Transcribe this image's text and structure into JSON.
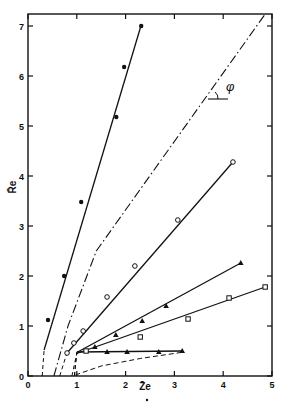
{
  "chart_data": {
    "type": "line",
    "title": "",
    "xlabel": "Z̄e",
    "ylabel": "R̄e",
    "xlim": [
      0,
      5
    ],
    "ylim": [
      0,
      7.24
    ],
    "grid": false,
    "legend": null,
    "x_ticks": [
      0,
      1,
      2,
      3,
      4,
      5
    ],
    "y_ticks": [
      0,
      1,
      2,
      3,
      4,
      5,
      6,
      7
    ],
    "x_tick_labels": [
      "0",
      "1",
      "2",
      "3",
      "4",
      "5"
    ],
    "y_tick_labels": [
      "0",
      "1",
      "2",
      "3",
      "4",
      "5",
      "6",
      "7"
    ],
    "annotations": [
      {
        "text": "φ",
        "x": 4.18,
        "y": 5.65,
        "note": "angle symbol marking slope of dash-dot line"
      }
    ],
    "series": [
      {
        "name": "filled circles",
        "marker": "filled-circle",
        "points": [
          [
            0.41,
            1.12
          ],
          [
            0.74,
            2.0
          ],
          [
            1.09,
            3.48
          ],
          [
            1.81,
            5.18
          ],
          [
            1.97,
            6.18
          ],
          [
            2.32,
            7.0
          ]
        ],
        "fit_line": [
          [
            0.33,
            0.52
          ],
          [
            2.32,
            7.02
          ]
        ],
        "dashed_extension": [
          [
            0.29,
            0.0
          ],
          [
            0.33,
            0.52
          ]
        ]
      },
      {
        "name": "open circles",
        "marker": "open-circle",
        "points": [
          [
            0.8,
            0.46
          ],
          [
            0.94,
            0.66
          ],
          [
            1.13,
            0.9
          ],
          [
            1.62,
            1.58
          ],
          [
            2.19,
            2.2
          ],
          [
            3.07,
            3.12
          ],
          [
            4.2,
            4.28
          ]
        ],
        "fit_line": [
          [
            0.8,
            0.46
          ],
          [
            4.2,
            4.28
          ]
        ],
        "dashed_extension": [
          [
            0.65,
            0.0
          ],
          [
            0.8,
            0.46
          ]
        ]
      },
      {
        "name": "filled triangles (upper)",
        "marker": "filled-triangle",
        "points": [
          [
            1.37,
            0.58
          ],
          [
            1.8,
            0.82
          ],
          [
            2.34,
            1.1
          ],
          [
            2.83,
            1.4
          ],
          [
            4.36,
            2.26
          ]
        ],
        "fit_line": [
          [
            1.0,
            0.47
          ],
          [
            4.36,
            2.26
          ]
        ],
        "dashed_extension": [
          [
            0.95,
            0.0
          ],
          [
            1.0,
            0.47
          ]
        ]
      },
      {
        "name": "open squares",
        "marker": "open-square",
        "points": [
          [
            1.19,
            0.5
          ],
          [
            2.3,
            0.78
          ],
          [
            3.28,
            1.14
          ],
          [
            4.12,
            1.56
          ],
          [
            4.86,
            1.78
          ]
        ],
        "fit_line": [
          [
            1.0,
            0.45
          ],
          [
            4.86,
            1.78
          ]
        ],
        "dashed_extension": [
          [
            0.9,
            0.0
          ],
          [
            1.0,
            0.45
          ]
        ]
      },
      {
        "name": "filled triangles (lower)",
        "marker": "filled-triangle",
        "points": [
          [
            1.62,
            0.48
          ],
          [
            2.03,
            0.48
          ],
          [
            2.68,
            0.48
          ],
          [
            3.16,
            0.5
          ]
        ],
        "fit_line": [
          [
            1.0,
            0.48
          ],
          [
            3.16,
            0.5
          ]
        ],
        "dashed_extension": [
          [
            0.95,
            0.0
          ],
          [
            1.0,
            0.48
          ]
        ]
      },
      {
        "name": "reference line (dash-dot)",
        "marker": "none",
        "style": "dash-dot",
        "points": [
          [
            0.53,
            0.0
          ],
          [
            0.82,
            1.0
          ],
          [
            1.4,
            2.5
          ],
          [
            4.86,
            7.24
          ]
        ]
      },
      {
        "name": "lower dashed curve",
        "marker": "none",
        "style": "dashed",
        "points": [
          [
            0.97,
            0.02
          ],
          [
            1.5,
            0.2
          ],
          [
            2.3,
            0.35
          ],
          [
            3.2,
            0.48
          ]
        ]
      }
    ]
  }
}
